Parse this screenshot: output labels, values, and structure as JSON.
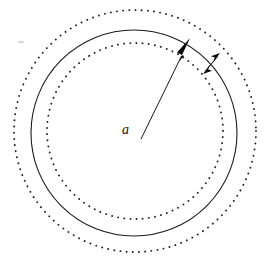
{
  "figure": {
    "background_color": "#ffffff",
    "width": 269,
    "height": 263,
    "labels": {
      "radius_label": "a"
    },
    "elements": {
      "solid_circle_name": "solid-circle",
      "inner_dotted_circle_name": "inner-dotted-circle",
      "outer_dotted_circle_name": "outer-dotted-circle",
      "radius_arrow_name": "radius-arrow",
      "gap_arrow_name": "gap-double-arrow"
    },
    "colors": {
      "stroke": "#1a1a1a",
      "dotted": "#222222",
      "arrow_fill": "#070707",
      "label": "#141414"
    }
  },
  "geometry": {
    "center": {
      "x": 135,
      "y": 131
    },
    "solid_circle": {
      "cx": 134,
      "cy": 133,
      "r": 103
    },
    "inner_dotted_circle": {
      "cx": 135,
      "cy": 131,
      "r": 88
    },
    "outer_dotted_circle": {
      "cx": 135,
      "cy": 131,
      "r": 121
    },
    "radius_arrow": {
      "x1": 141,
      "y1": 139,
      "x2": 190,
      "y2": 38
    },
    "gap_arrow": {
      "x1": 204,
      "y1": 73,
      "x2": 219,
      "y2": 55
    },
    "label_a_position": {
      "x": 122,
      "y": 134
    }
  }
}
